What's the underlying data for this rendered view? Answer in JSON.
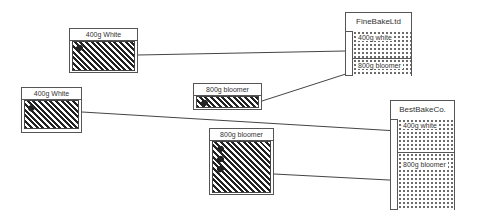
{
  "products": [
    {
      "id": "p1",
      "label": "400g White",
      "dots": 1
    },
    {
      "id": "p2",
      "label": "400g White",
      "dots": 1
    },
    {
      "id": "p3",
      "label": "800g bloomer",
      "dots": 1
    },
    {
      "id": "p4",
      "label": "800g bloomer",
      "dots": 3
    }
  ],
  "companies": [
    {
      "id": "c1",
      "name": "FineBakeLtd",
      "slots": [
        "400g white",
        "800g bloomer"
      ]
    },
    {
      "id": "c2",
      "name": "BestBakeCo.",
      "slots": [
        "400g white",
        "800g bloomer"
      ]
    }
  ],
  "connections": [
    {
      "from": "400g White (top)",
      "to": "FineBakeLtd / 400g white"
    },
    {
      "from": "800g bloomer (small)",
      "to": "FineBakeLtd / 800g bloomer"
    },
    {
      "from": "400g White (left)",
      "to": "BestBakeCo. / 400g white"
    },
    {
      "from": "800g bloomer (large)",
      "to": "BestBakeCo. / 800g bloomer"
    }
  ],
  "colors": {
    "line": "#444444",
    "hatch": "#222222",
    "border": "#555555"
  }
}
